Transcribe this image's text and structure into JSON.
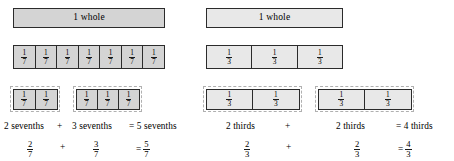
{
  "colors": {
    "bar_fill_left": "#d4d4d4",
    "bar_fill_right": "#e8e8e8",
    "bar_border": "#2b2b2b",
    "group_outline": "#b0b0b0",
    "background": "#ffffff",
    "text": "#000000"
  },
  "panels": [
    {
      "id": "sevenths",
      "whole_label": "1 whole",
      "unit_fraction": {
        "numerator": "1",
        "denominator": "7"
      },
      "partition_count": 7,
      "groups": [
        {
          "count": 2,
          "label": "2 sevenths"
        },
        {
          "count": 3,
          "label": "3 sevenths"
        }
      ],
      "word_equation": {
        "first": "2 sevenths",
        "operator": "+",
        "second": "3 sevenths",
        "result": "= 5 sevenths"
      },
      "symbol_equation": {
        "first": {
          "numerator": "2",
          "denominator": "7"
        },
        "operator": "+",
        "second": {
          "numerator": "3",
          "denominator": "7"
        },
        "equals": "=",
        "result": {
          "numerator": "5",
          "denominator": "7"
        }
      }
    },
    {
      "id": "thirds",
      "whole_label": "1 whole",
      "unit_fraction": {
        "numerator": "1",
        "denominator": "3"
      },
      "partition_count": 3,
      "groups": [
        {
          "count": 2,
          "label": "2 thirds"
        },
        {
          "count": 2,
          "label": "2 thirds"
        }
      ],
      "word_equation": {
        "first": "2 thirds",
        "operator": "+",
        "second": "2 thirds",
        "result": "= 4 thirds"
      },
      "symbol_equation": {
        "first": {
          "numerator": "2",
          "denominator": "3"
        },
        "operator": "+",
        "second": {
          "numerator": "2",
          "denominator": "3"
        },
        "equals": "=",
        "result": {
          "numerator": "4",
          "denominator": "3"
        }
      }
    }
  ]
}
